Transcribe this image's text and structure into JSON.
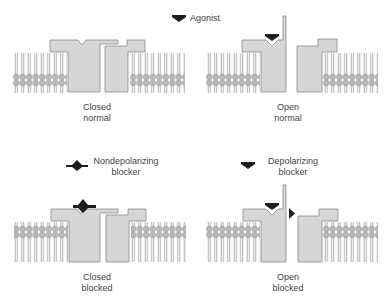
{
  "colors": {
    "protein_fill": "#d6d6d6",
    "protein_stroke": "#8c8c8c",
    "lipid_head": "#b5b5b5",
    "lipid_tail": "#8a8a8a",
    "drug": "#1e1e1e"
  },
  "legend": {
    "agonist": "Agonist",
    "nondepolarizing": [
      "Nondepolarizing",
      "blocker"
    ],
    "depolarizing": [
      "Depolarizing",
      "blocker"
    ]
  },
  "panels": [
    {
      "id": "closed-normal",
      "label": [
        "Closed",
        "normal"
      ]
    },
    {
      "id": "open-normal",
      "label": [
        "Open",
        "normal"
      ]
    },
    {
      "id": "closed-blocked",
      "label": [
        "Closed",
        "blocked"
      ]
    },
    {
      "id": "open-blocked",
      "label": [
        "Open",
        "blocked"
      ]
    }
  ]
}
